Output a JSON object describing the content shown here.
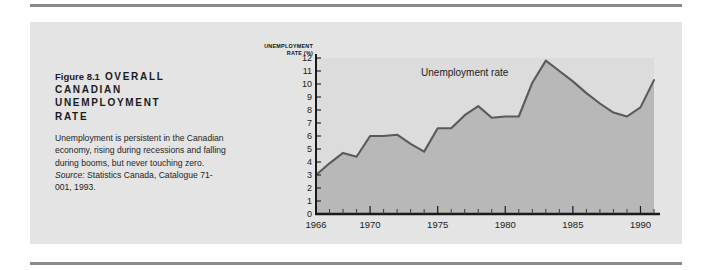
{
  "figure": {
    "number": "Figure 8.1",
    "title": "OVERALL CANADIAN UNEMPLOYMENT RATE",
    "title_line1": "OVERALL",
    "title_line2": "CANADIAN",
    "title_line3": "UNEMPLOYMENT",
    "title_line4": "RATE",
    "caption": "Unemployment is persistent in the Canadian economy, rising during recessions and falling during booms, but never touching zero. Source: Statistics Canada, Catalogue 71-001, 1993.",
    "caption_lead": "Unemployment is persistent in the Canadian economy, rising during recessions and falling during booms, but never touching zero. ",
    "caption_source_label": "Source:",
    "caption_source_text": " Statistics Canada, Catalogue 71-001, 1993."
  },
  "colors": {
    "page_background": "#ffffff",
    "panel_background": "#e4e4e4",
    "rule": "#888b8d",
    "plot_background": "#dcdcdc",
    "area_fill": "#b8b8b8",
    "line": "#5a5a5a",
    "axis": "#1a1a1a",
    "text": "#1b1b1b"
  },
  "chart_data": {
    "type": "area",
    "title": "",
    "xlabel": "",
    "ylabel": "UNEMPLOYMENT RATE (%)",
    "ylabel_line1": "UNEMPLOYMENT",
    "ylabel_line2": "RATE (%)",
    "xlim": [
      1966,
      1991
    ],
    "ylim": [
      0,
      12
    ],
    "grid": false,
    "legend": "none",
    "annotations": [
      {
        "text": "Unemployment rate",
        "x": 1977,
        "y": 10.6
      }
    ],
    "ytick_labels": [
      "0",
      "1",
      "2",
      "3",
      "4",
      "5",
      "6",
      "7",
      "8",
      "9",
      "10",
      "11",
      "12"
    ],
    "yticks": [
      0,
      1,
      2,
      3,
      4,
      5,
      6,
      7,
      8,
      9,
      10,
      11,
      12
    ],
    "xtick_labels": [
      "1966",
      "1970",
      "1975",
      "1980",
      "1985",
      "1990"
    ],
    "xticks": [
      1966,
      1970,
      1975,
      1980,
      1985,
      1990
    ],
    "x_minor_ticks": [
      1967,
      1968,
      1969,
      1971,
      1972,
      1973,
      1974,
      1976,
      1977,
      1978,
      1979,
      1981,
      1982,
      1983,
      1984,
      1986,
      1987,
      1988,
      1989,
      1991
    ],
    "series": [
      {
        "name": "Unemployment rate",
        "x": [
          1966,
          1967,
          1968,
          1969,
          1970,
          1971,
          1972,
          1973,
          1974,
          1975,
          1976,
          1977,
          1978,
          1979,
          1980,
          1981,
          1982,
          1983,
          1984,
          1985,
          1986,
          1987,
          1988,
          1989,
          1990,
          1991
        ],
        "values": [
          3.0,
          3.9,
          4.7,
          4.4,
          6.0,
          6.0,
          6.1,
          5.4,
          4.8,
          6.6,
          6.6,
          7.6,
          8.3,
          7.4,
          7.5,
          7.5,
          10.1,
          11.8,
          11.0,
          10.2,
          9.3,
          8.5,
          7.8,
          7.5,
          8.2,
          10.3
        ]
      }
    ]
  }
}
